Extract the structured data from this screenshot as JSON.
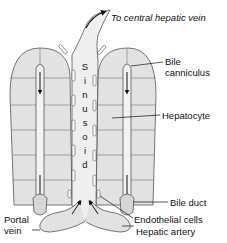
{
  "labels": {
    "central_vein": "To central hepatic vein",
    "bile_canniculus_1": "Bile",
    "bile_canniculus_2": "canniculus",
    "hepatocyte": "Hepatocyte",
    "bile_duct": "Bile duct",
    "endothelial": "Endothelial cells",
    "portal_vein_1": "Portal",
    "portal_vein_2": "vein",
    "hepatic_artery": "Hepatic artery",
    "sinusoid_letters": [
      "S",
      "i",
      "n",
      "u",
      "s",
      "o",
      "i",
      "d"
    ]
  },
  "colors": {
    "cell_fill": "#e2e2e2",
    "sinusoid_fill": "#efefef",
    "stroke": "#555555",
    "text": "#111111"
  }
}
